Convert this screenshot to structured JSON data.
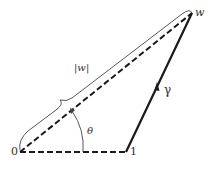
{
  "figure": {
    "points": {
      "origin": {
        "label": "0",
        "x": 20,
        "y": 152
      },
      "one": {
        "label": "1",
        "x": 126,
        "y": 152
      },
      "w": {
        "label": "w",
        "x": 192,
        "y": 13
      }
    },
    "labels": {
      "modulus": "|w|",
      "angle": "θ",
      "path": "γ"
    },
    "colors": {
      "stroke": "#1a1a1a",
      "text": "#333333",
      "background": "#ffffff"
    }
  }
}
